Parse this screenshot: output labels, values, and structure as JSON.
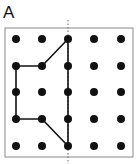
{
  "figure": {
    "panel_label": "A",
    "frame": {
      "x": 5,
      "y": 28,
      "width": 128,
      "height": 129,
      "stroke": "#888888"
    },
    "grid": {
      "cols": 5,
      "rows": 5,
      "x_positions": [
        16,
        42,
        68,
        94,
        121
      ],
      "y_positions": [
        39,
        66,
        92,
        119,
        146
      ],
      "dot_radius": 4,
      "dot_color": "#111111"
    },
    "symmetry_axis": {
      "x": 68,
      "y1": 20,
      "y2": 164,
      "style": "dotted",
      "color": "#666666"
    },
    "shape": {
      "points_grid": [
        [
          2,
          0
        ],
        [
          1,
          1
        ],
        [
          0,
          1
        ],
        [
          0,
          3
        ],
        [
          1,
          3
        ],
        [
          2,
          4
        ]
      ],
      "closed": true,
      "stroke": "#111111",
      "stroke_width": 1.6
    }
  }
}
